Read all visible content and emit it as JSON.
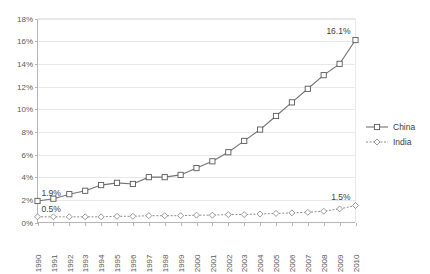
{
  "chart_data": {
    "type": "line",
    "title": "",
    "xlabel": "",
    "ylabel": "",
    "x": [
      1990,
      1991,
      1992,
      1993,
      1994,
      1995,
      1996,
      1997,
      1998,
      1999,
      2000,
      2001,
      2002,
      2003,
      2004,
      2005,
      2006,
      2007,
      2008,
      2009,
      2010
    ],
    "categories": [
      "1990",
      "1991",
      "1992",
      "1993",
      "1994",
      "1995",
      "1996",
      "1997",
      "1998",
      "1999",
      "2000",
      "2001",
      "2002",
      "2003",
      "2004",
      "2005",
      "2006",
      "2007",
      "2008",
      "2009",
      "2010"
    ],
    "ylim": [
      0,
      18
    ],
    "ytick_step": 2,
    "ytick_labels": [
      "0%",
      "2%",
      "4%",
      "6%",
      "8%",
      "10%",
      "12%",
      "14%",
      "16%",
      "18%"
    ],
    "ytick_values": [
      0,
      2,
      4,
      6,
      8,
      10,
      12,
      14,
      16,
      18
    ],
    "grid": "horizontal",
    "legend_position": "right",
    "series": [
      {
        "name": "China",
        "marker": "square",
        "line_style": "solid",
        "color": "#737373",
        "values": [
          1.9,
          2.1,
          2.5,
          2.8,
          3.3,
          3.5,
          3.4,
          4.0,
          4.0,
          4.2,
          4.8,
          5.4,
          6.2,
          7.2,
          8.2,
          9.4,
          10.6,
          11.8,
          13.0,
          14.0,
          16.1
        ]
      },
      {
        "name": "India",
        "marker": "diamond",
        "line_style": "dotted",
        "color": "#8c8c8c",
        "values": [
          0.5,
          0.5,
          0.5,
          0.5,
          0.5,
          0.55,
          0.55,
          0.6,
          0.6,
          0.6,
          0.65,
          0.65,
          0.7,
          0.7,
          0.75,
          0.8,
          0.85,
          0.9,
          1.0,
          1.2,
          1.5
        ]
      }
    ],
    "annotations": [
      {
        "text": "1.9%",
        "series": "China",
        "x": 1990,
        "y": 1.9,
        "position": "above-right"
      },
      {
        "text": "0.5%",
        "series": "India",
        "x": 1990,
        "y": 0.5,
        "position": "above-right"
      },
      {
        "text": "16.1%",
        "series": "China",
        "x": 2010,
        "y": 16.1,
        "position": "above-left"
      },
      {
        "text": "1.5%",
        "series": "India",
        "x": 2010,
        "y": 1.5,
        "position": "above-left"
      }
    ]
  },
  "legend": {
    "items": [
      {
        "label": "China"
      },
      {
        "label": "India"
      }
    ]
  },
  "colors": {
    "china": "#737373",
    "india": "#8c8c8c",
    "grid": "#e8e8e8",
    "axis": "#b5b5b5",
    "text": "#595959",
    "background": "#ffffff"
  }
}
